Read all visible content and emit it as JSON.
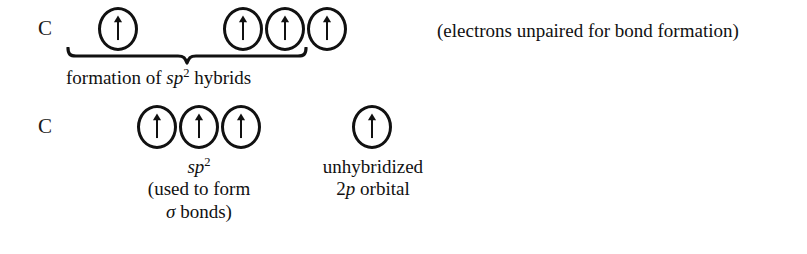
{
  "diagram": {
    "background_color": "#ffffff",
    "ink_color": "#111111"
  },
  "row1": {
    "atom_label": "C",
    "orbitals": [
      {
        "name": "orbital-1",
        "electron": "up-arrow",
        "x": 98,
        "y": 7
      },
      {
        "name": "orbital-2",
        "electron": "up-arrow",
        "x": 223,
        "y": 7
      },
      {
        "name": "orbital-3",
        "electron": "up-arrow",
        "x": 265,
        "y": 7
      },
      {
        "name": "orbital-4",
        "electron": "up-arrow",
        "x": 307,
        "y": 7
      }
    ],
    "brace_caption": {
      "prefix": "formation of ",
      "italic": "sp",
      "superscript": "2",
      "suffix": " hybrids"
    },
    "side_note": "(electrons unpaired for bond formation)"
  },
  "row2": {
    "atom_label": "C",
    "orbitals": [
      {
        "name": "orbital-1",
        "electron": "up-arrow",
        "x": 137,
        "y": 105
      },
      {
        "name": "orbital-2",
        "electron": "up-arrow",
        "x": 179,
        "y": 105
      },
      {
        "name": "orbital-3",
        "electron": "up-arrow",
        "x": 221,
        "y": 105
      },
      {
        "name": "orbital-4",
        "electron": "up-arrow",
        "x": 352,
        "y": 105
      }
    ],
    "sp2_caption": {
      "italic": "sp",
      "superscript": "2",
      "line2": "(used to form",
      "line3_symbol": "σ",
      "line3_rest": " bonds)"
    },
    "p_orbital_caption": {
      "line1": "unhybridized",
      "line2_number": "2",
      "line2_italic": "p",
      "line2_rest": " orbital"
    }
  }
}
